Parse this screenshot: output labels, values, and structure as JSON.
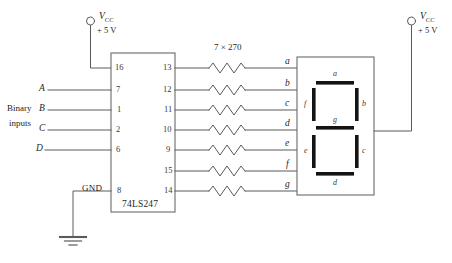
{
  "diagram": {
    "title_ic": "74LS247",
    "resistor_bank_label": "7 × 270",
    "ground_label": "GND",
    "binary_inputs_label_line1": "Binary",
    "binary_inputs_label_line2": "inputs",
    "power_left": {
      "name": "V",
      "subscript": "CC",
      "voltage": "+ 5 V"
    },
    "power_right": {
      "name": "V",
      "subscript": "CC",
      "voltage": "+ 5 V"
    },
    "input_signals": [
      {
        "label": "A",
        "pin": "7"
      },
      {
        "label": "B",
        "pin": "1"
      },
      {
        "label": "C",
        "pin": "2"
      },
      {
        "label": "D",
        "pin": "6"
      }
    ],
    "left_pins": [
      {
        "number": "16",
        "y": 68
      },
      {
        "number": "7",
        "y": 90
      },
      {
        "number": "1",
        "y": 110
      },
      {
        "number": "2",
        "y": 130
      },
      {
        "number": "6",
        "y": 150
      },
      {
        "number": "8",
        "y": 191
      }
    ],
    "output_pins": [
      {
        "number": "13",
        "segment": "a",
        "y": 68
      },
      {
        "number": "12",
        "segment": "b",
        "y": 90
      },
      {
        "number": "11",
        "segment": "c",
        "y": 110
      },
      {
        "number": "10",
        "segment": "d",
        "y": 130
      },
      {
        "number": "9",
        "segment": "e",
        "y": 150
      },
      {
        "number": "15",
        "segment": "f",
        "y": 171
      },
      {
        "number": "14",
        "segment": "g",
        "y": 191
      }
    ],
    "display_segments": [
      {
        "id": "a",
        "label": "a"
      },
      {
        "id": "b",
        "label": "b"
      },
      {
        "id": "c",
        "label": "c"
      },
      {
        "id": "d",
        "label": "d"
      },
      {
        "id": "e",
        "label": "e"
      },
      {
        "id": "f",
        "label": "f"
      },
      {
        "id": "g",
        "label": "g"
      }
    ],
    "colors": {
      "wire": "#555555",
      "segment": "#111111",
      "box_border": "#666666",
      "text": "#222222",
      "background": "#ffffff"
    }
  }
}
